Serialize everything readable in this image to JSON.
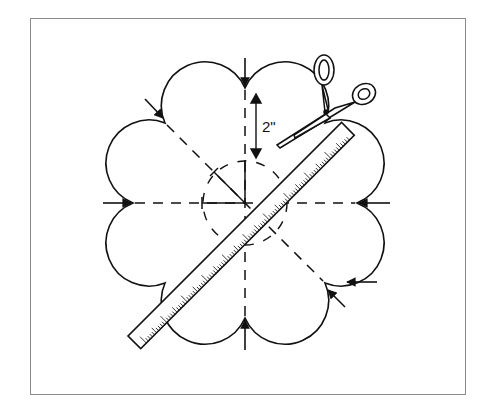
{
  "figure": {
    "type": "illustration",
    "dimension_label": "2\"",
    "colors": {
      "line": "#111111",
      "frame": "#8a8a8a",
      "background": "#ffffff"
    },
    "elements": [
      "frame",
      "scalloped-outline",
      "dashed-guides",
      "dashed-inner-circle",
      "arrows",
      "ruler",
      "scissors",
      "dimension-arrow"
    ]
  }
}
